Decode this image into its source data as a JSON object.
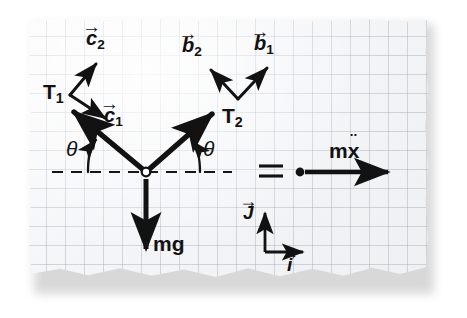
{
  "figure": {
    "medium": "hand drawing on torn graph paper",
    "paper_color": "#f4f5f7",
    "grid_color": "#969eac",
    "ink_color": "#121212"
  },
  "labels": {
    "tension_left": "T",
    "tension_left_sub": "1",
    "tension_right": "T",
    "tension_right_sub": "2",
    "unit_c2": "c",
    "unit_c2_sub": "2",
    "unit_c1": "c",
    "unit_c1_sub": "1",
    "unit_b2": "b",
    "unit_b2_sub": "2",
    "unit_b1": "b",
    "unit_b1_sub": "1",
    "angle_left": "θ",
    "angle_right": "θ",
    "weight": "mg",
    "equals": "=",
    "inertial_term": "m",
    "inertial_var": "x",
    "inertial_accent": "¨",
    "basis_j": "J",
    "basis_i": "i",
    "vector_accent": "→"
  },
  "geometry": {
    "pivot": {
      "x": 146,
      "y": 172,
      "radius": 4
    },
    "dashed_line": {
      "x1": 52,
      "x2": 232,
      "y": 172
    },
    "tension_left_vector": {
      "from_x": 146,
      "from_y": 172,
      "to_x": 71,
      "to_y": 110,
      "angle_deg": 39
    },
    "tension_right_vector": {
      "from_x": 146,
      "from_y": 172,
      "to_x": 215,
      "to_y": 112,
      "angle_deg": 41
    },
    "weight_vector": {
      "from_x": 146,
      "from_y": 178,
      "to_x": 146,
      "to_y": 252
    },
    "mx_vector": {
      "from_x": 305,
      "from_y": 172,
      "to_x": 392,
      "to_y": 172
    },
    "point_mass": {
      "x": 299,
      "y": 172,
      "radius": 4
    },
    "basis_origin": {
      "x": 265,
      "y": 252
    },
    "basis_j_tip": {
      "x": 265,
      "y": 212
    },
    "basis_i_tip": {
      "x": 305,
      "y": 252
    }
  },
  "annotations": {
    "description": "Two string tensions T1 and T2 act at angle theta above a horizontal dashed reference line, gravity mg acts downward, and the net result equals m times x-double-dot to the right.",
    "frames": [
      {
        "name": "c-frame",
        "vectors": [
          "c1",
          "c2"
        ],
        "attached_to": "T1"
      },
      {
        "name": "b-frame",
        "vectors": [
          "b1",
          "b2"
        ],
        "attached_to": "T2"
      },
      {
        "name": "global-frame",
        "vectors": [
          "i",
          "J"
        ]
      }
    ]
  }
}
